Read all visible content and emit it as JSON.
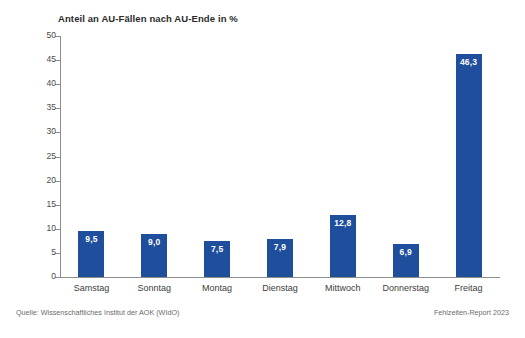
{
  "chart_data": {
    "type": "bar",
    "title": "Anteil an AU-Fällen nach AU-Ende in %",
    "xlabel": "",
    "ylabel": "",
    "ylim": [
      0,
      50
    ],
    "ytick_step": 5,
    "yticks": [
      "50",
      "45",
      "40",
      "35",
      "30",
      "25",
      "20",
      "15",
      "10",
      "5",
      "0"
    ],
    "grid": false,
    "legend": "none",
    "decimal_separator": ",",
    "categories": [
      "Samstag",
      "Sonntag",
      "Montag",
      "Dienstag",
      "Mittwoch",
      "Donnerstag",
      "Freitag"
    ],
    "values": [
      9.5,
      9.0,
      7.5,
      7.9,
      12.8,
      6.9,
      46.3
    ],
    "value_labels": [
      "9,5",
      "9,0",
      "7,5",
      "7,9",
      "12,8",
      "6,9",
      "46,3"
    ],
    "bar_color": "#1f4e9c",
    "value_label_color": "#ffffff",
    "axis_color": "#8d8d8d"
  },
  "footer": {
    "source": "Quelle: Wissenschaftliches Institut der AOK (WIdO)",
    "report": "Fehlzeiten-Report 2023"
  }
}
